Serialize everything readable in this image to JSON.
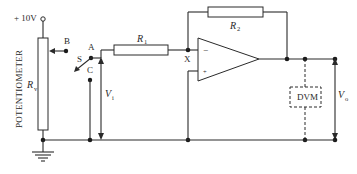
{
  "diagram": {
    "type": "circuit-schematic",
    "supply_label": "+ 10V",
    "potentiometer": {
      "label": "POTENTIOMETER",
      "symbol": "R",
      "subscript": "v"
    },
    "switch": {
      "label": "S",
      "terminals": [
        "A",
        "B",
        "C"
      ]
    },
    "input_voltage": {
      "symbol": "V",
      "subscript": "i"
    },
    "input_resistor": {
      "symbol": "R",
      "subscript": "1"
    },
    "feedback_resistor": {
      "symbol": "R",
      "subscript": "2"
    },
    "summing_node": "X",
    "opamp": {
      "inverting": "−",
      "non_inverting": "+"
    },
    "meter": {
      "label": "DVM"
    },
    "output_voltage": {
      "symbol": "V",
      "subscript": "o"
    },
    "ground": "ground-symbol",
    "colors": {
      "line": "#2a2a2a",
      "background": "#ffffff"
    }
  }
}
